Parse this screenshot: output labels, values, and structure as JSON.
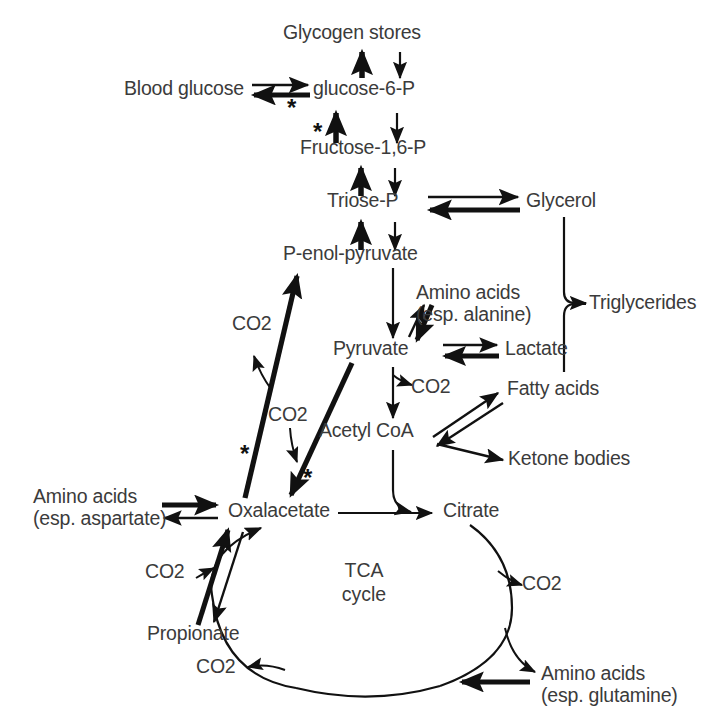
{
  "diagram": {
    "stroke_color": "#111111",
    "text_color": "#3b3b3b",
    "background": "#ffffff"
  },
  "nodes": {
    "glycogen_stores": "Glycogen stores",
    "blood_glucose": "Blood glucose",
    "glucose_6_p": "glucose-6-P",
    "fructose_16_p": "Fructose-1,6-P",
    "triose_p": "Triose-P",
    "glycerol": "Glycerol",
    "p_enol_pyruvate": "P-enol-pyruvate",
    "amino_acids_alanine_line1": "Amino acids",
    "amino_acids_alanine_line2": "(esp. alanine)",
    "triglycerides": "Triglycerides",
    "pyruvate": "Pyruvate",
    "lactate": "Lactate",
    "fatty_acids": "Fatty acids",
    "acetyl_coa": "Acetyl CoA",
    "ketone_bodies": "Ketone bodies",
    "amino_acids_aspartate_line1": "Amino acids",
    "amino_acids_aspartate_line2": "(esp. aspartate)",
    "oxalacetate": "Oxalacetate",
    "citrate": "Citrate",
    "propionate": "Propionate",
    "amino_acids_glutamine_line1": "Amino acids",
    "amino_acids_glutamine_line2": "(esp. glutamine)",
    "tca_cycle_line1": "TCA",
    "tca_cycle_line2": "cycle"
  },
  "co2_labels": {
    "pep_release": "CO2",
    "pyruvate_carboxylation": "CO2",
    "pyruvate_to_acetylcoa": "CO2",
    "propionate_entry": "CO2",
    "tca_right": "CO2",
    "tca_bottom": "CO2"
  },
  "co2_text": {
    "main": "CO",
    "subscript": "2"
  },
  "markers": {
    "asterisk": "*",
    "asterisk_count": 4,
    "asterisk_meaning_positions": [
      "glucose-6-P to Blood glucose",
      "Fructose-1,6-P to glucose-6-P",
      "Oxalacetate to P-enol-pyruvate",
      "Pyruvate to Oxalacetate"
    ]
  },
  "edges": [
    {
      "id": "g6p-to-glycogen",
      "from": "glucose-6-P",
      "to": "Glycogen stores",
      "style": "thick-up"
    },
    {
      "id": "glycogen-to-g6p",
      "from": "Glycogen stores",
      "to": "glucose-6-P",
      "style": "thin-down"
    },
    {
      "id": "g6p-to-blood-glucose",
      "from": "glucose-6-P",
      "to": "Blood glucose",
      "style": "thick-left",
      "starred": true
    },
    {
      "id": "blood-glucose-to-g6p",
      "from": "Blood glucose",
      "to": "glucose-6-P",
      "style": "thin-right"
    },
    {
      "id": "f16p-to-g6p",
      "from": "Fructose-1,6-P",
      "to": "glucose-6-P",
      "style": "thick-up",
      "starred": true
    },
    {
      "id": "g6p-to-f16p",
      "from": "glucose-6-P",
      "to": "Fructose-1,6-P",
      "style": "thin-down"
    },
    {
      "id": "triose-to-f16p",
      "from": "Triose-P",
      "to": "Fructose-1,6-P",
      "style": "thick-up"
    },
    {
      "id": "f16p-to-triose",
      "from": "Fructose-1,6-P",
      "to": "Triose-P",
      "style": "thin-down"
    },
    {
      "id": "triose-to-glycerol",
      "from": "Triose-P",
      "to": "Glycerol",
      "style": "thin-right"
    },
    {
      "id": "glycerol-to-triose",
      "from": "Glycerol",
      "to": "Triose-P",
      "style": "thick-left"
    },
    {
      "id": "pep-to-triose",
      "from": "P-enol-pyruvate",
      "to": "Triose-P",
      "style": "thick-up"
    },
    {
      "id": "triose-to-pep",
      "from": "Triose-P",
      "to": "P-enol-pyruvate",
      "style": "thin-down"
    },
    {
      "id": "pep-to-pyruvate",
      "from": "P-enol-pyruvate",
      "to": "Pyruvate",
      "style": "thin-down"
    },
    {
      "id": "glycerol-to-triglycerides",
      "from": "Glycerol",
      "to": "Triglycerides",
      "style": "thin-curve"
    },
    {
      "id": "fattyacids-to-triglycerides",
      "from": "Fatty acids",
      "to": "Triglycerides",
      "style": "thin-curve"
    },
    {
      "id": "aminoacids-to-pyruvate",
      "from": "Amino acids (esp. alanine)",
      "to": "Pyruvate",
      "style": "thick-down"
    },
    {
      "id": "pyruvate-to-aminoacids",
      "from": "Pyruvate",
      "to": "Amino acids (esp. alanine)",
      "style": "thin-up"
    },
    {
      "id": "lactate-to-pyruvate",
      "from": "Lactate",
      "to": "Pyruvate",
      "style": "thick-left"
    },
    {
      "id": "pyruvate-to-lactate",
      "from": "Pyruvate",
      "to": "Lactate",
      "style": "thin-right"
    },
    {
      "id": "pyruvate-to-acetylcoa",
      "from": "Pyruvate",
      "to": "Acetyl CoA",
      "style": "thin-down",
      "releases": "CO2"
    },
    {
      "id": "oaa-to-pep",
      "from": "Oxalacetate",
      "to": "P-enol-pyruvate",
      "style": "thick-diagonal",
      "starred": true,
      "releases": "CO2"
    },
    {
      "id": "pyruvate-to-oaa",
      "from": "Pyruvate",
      "to": "Oxalacetate",
      "style": "thick-diagonal",
      "starred": true,
      "consumes": "CO2"
    },
    {
      "id": "acetylcoa-to-fattyacids",
      "from": "Acetyl CoA",
      "to": "Fatty acids",
      "style": "thin-diagonal"
    },
    {
      "id": "fattyacids-to-acetylcoa",
      "from": "Fatty acids",
      "to": "Acetyl CoA",
      "style": "thin-diagonal"
    },
    {
      "id": "acetylcoa-to-ketones",
      "from": "Acetyl CoA",
      "to": "Ketone bodies",
      "style": "thin-diagonal"
    },
    {
      "id": "acetylcoa-to-citrate",
      "from": "Acetyl CoA",
      "to": "Citrate",
      "style": "thin-curve"
    },
    {
      "id": "oaa-to-citrate",
      "from": "Oxalacetate",
      "to": "Citrate",
      "style": "thin-right"
    },
    {
      "id": "aminoacids-to-oaa",
      "from": "Amino acids (esp. aspartate)",
      "to": "Oxalacetate",
      "style": "thick-right"
    },
    {
      "id": "oaa-to-aminoacids",
      "from": "Oxalacetate",
      "to": "Amino acids (esp. aspartate)",
      "style": "thin-left"
    },
    {
      "id": "propionate-to-oaa",
      "from": "Propionate",
      "to": "Oxalacetate",
      "style": "thick-diagonal",
      "consumes": "CO2"
    },
    {
      "id": "oaa-to-propionate",
      "from": "Oxalacetate",
      "to": "Propionate",
      "style": "thin-diagonal"
    },
    {
      "id": "citrate-tca-right",
      "from": "Citrate",
      "to": "TCA cycle",
      "style": "tca-arc",
      "releases": "CO2"
    },
    {
      "id": "tca-bottom-co2",
      "from": "TCA cycle",
      "to": "CO2",
      "style": "tca-arc"
    },
    {
      "id": "aminoacids-glutamine-to-tca",
      "from": "Amino acids (esp. glutamine)",
      "to": "TCA cycle",
      "style": "thick-left"
    },
    {
      "id": "tca-to-oaa",
      "from": "TCA cycle",
      "to": "Oxalacetate",
      "style": "tca-arc"
    }
  ]
}
